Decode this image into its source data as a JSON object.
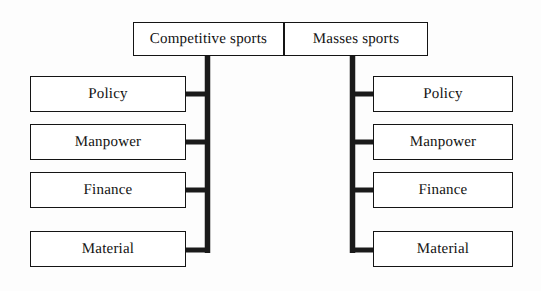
{
  "diagram": {
    "style": {
      "line_color": "#1a1a1a",
      "box_border_color": "#141414",
      "background": "#ffffff",
      "text_color": "#111111"
    },
    "branches": [
      {
        "id": "competitive",
        "root_label": "Competitive sports",
        "side": "left",
        "children": [
          {
            "label": "Policy"
          },
          {
            "label": "Manpower"
          },
          {
            "label": "Finance"
          },
          {
            "label": "Material"
          }
        ]
      },
      {
        "id": "masses",
        "root_label": "Masses sports",
        "side": "right",
        "children": [
          {
            "label": "Policy"
          },
          {
            "label": "Manpower"
          },
          {
            "label": "Finance"
          },
          {
            "label": "Material"
          }
        ]
      }
    ]
  }
}
